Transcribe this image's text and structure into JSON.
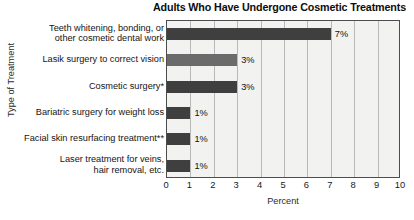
{
  "chart_data": {
    "type": "bar",
    "orientation": "horizontal",
    "title": "Adults Who Have Undergone Cosmetic Treatments",
    "xlabel": "Percent",
    "ylabel": "Type of Treatment",
    "xlim": [
      0,
      10
    ],
    "xticks": [
      "0",
      "1",
      "2",
      "3",
      "4",
      "5",
      "6",
      "7",
      "8",
      "9",
      "10"
    ],
    "grid": true,
    "legend": "none",
    "categories": [
      "Teeth whitening, bonding, or\nother cosmetic dental work",
      "Lasik surgery to correct vision",
      "Cosmetic surgery*",
      "Bariatric surgery for weight loss",
      "Facial skin resurfacing treatment**",
      "Laser treatment for veins,\nhair removal, etc."
    ],
    "values": [
      7,
      3,
      3,
      1,
      1,
      1
    ],
    "data_labels": [
      "7%",
      "3%",
      "3%",
      "1%",
      "1%",
      "1%"
    ],
    "bar_shades": [
      "dark",
      "light",
      "dark",
      "dark",
      "dark",
      "dark"
    ],
    "colors": {
      "bar_dark": "#3f3f3f",
      "bar_light": "#6b6b6b",
      "plot_background": "#f2f2f0",
      "gridline": "#b8b8b8",
      "axis": "#4d4d4d",
      "text": "#141414"
    }
  }
}
